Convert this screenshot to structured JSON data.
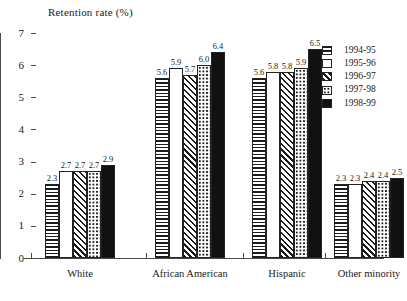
{
  "chart_data": {
    "type": "bar",
    "title": "Retention rate (%)",
    "xlabel": "",
    "ylabel": "",
    "ylim": [
      0,
      7
    ],
    "yticks": [
      0,
      1,
      2,
      3,
      4,
      5,
      6,
      7
    ],
    "grid": false,
    "legend_position": "right",
    "categories": [
      "White",
      "African American",
      "Hispanic",
      "Other minority"
    ],
    "series": [
      {
        "name": "1994-95",
        "pattern": "horizontal-lines",
        "values": [
          2.3,
          5.6,
          5.6,
          2.3
        ]
      },
      {
        "name": "1995-96",
        "pattern": "white",
        "values": [
          2.7,
          5.9,
          5.8,
          2.3
        ]
      },
      {
        "name": "1996-97",
        "pattern": "diagonal-hatch",
        "values": [
          2.7,
          5.7,
          5.8,
          2.4
        ]
      },
      {
        "name": "1997-98",
        "pattern": "dotted",
        "values": [
          2.7,
          6.0,
          5.9,
          2.4
        ]
      },
      {
        "name": "1998-99",
        "pattern": "solid-black",
        "values": [
          2.9,
          6.4,
          6.5,
          2.5
        ]
      }
    ],
    "value_labels": {
      "White": [
        "2.3",
        "2.7",
        "2.7",
        "2.7",
        "2.9"
      ],
      "African American": [
        "5.6",
        "5.9",
        "5.7",
        "6.0",
        "6.4"
      ],
      "Hispanic": [
        "5.6",
        "5.8",
        "5.8",
        "5.9",
        "6.5"
      ],
      "Other minority": [
        "2.3",
        "2.3",
        "2.4",
        "2.4",
        "2.5"
      ]
    },
    "ytick_labels": [
      "0",
      "1",
      "2",
      "3",
      "4",
      "5",
      "6",
      "7"
    ],
    "colors": {
      "axis": "#4a4a4a",
      "bar_outline": "#222222",
      "solid_fill": "#111111",
      "text": "#1a1a1a",
      "background": "#ffffff"
    }
  }
}
